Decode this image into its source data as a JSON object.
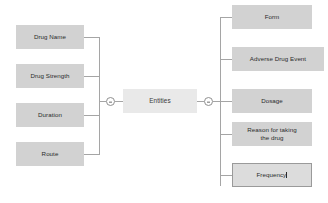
{
  "diagram": {
    "type": "mind-map-tree",
    "root": {
      "label": "Entities"
    },
    "left_branch": {
      "toggle": "collapse-minus-icon",
      "children": [
        {
          "label": "Drug Name"
        },
        {
          "label": "Drug Strength"
        },
        {
          "label": "Duration"
        },
        {
          "label": "Route"
        }
      ]
    },
    "right_branch": {
      "toggle": "collapse-minus-icon",
      "children": [
        {
          "label": "Form"
        },
        {
          "label": "Adverse Drug Event"
        },
        {
          "label": "Dosage"
        },
        {
          "label": "Reason for taking\nthe drug"
        },
        {
          "label": "Frequency",
          "editing": true
        }
      ]
    },
    "colors": {
      "node_fill": "#d2d2d2",
      "root_fill": "#e9e9e9",
      "connector": "#a5a5a5",
      "text": "#2b2b2b",
      "background": "#ffffff"
    }
  }
}
